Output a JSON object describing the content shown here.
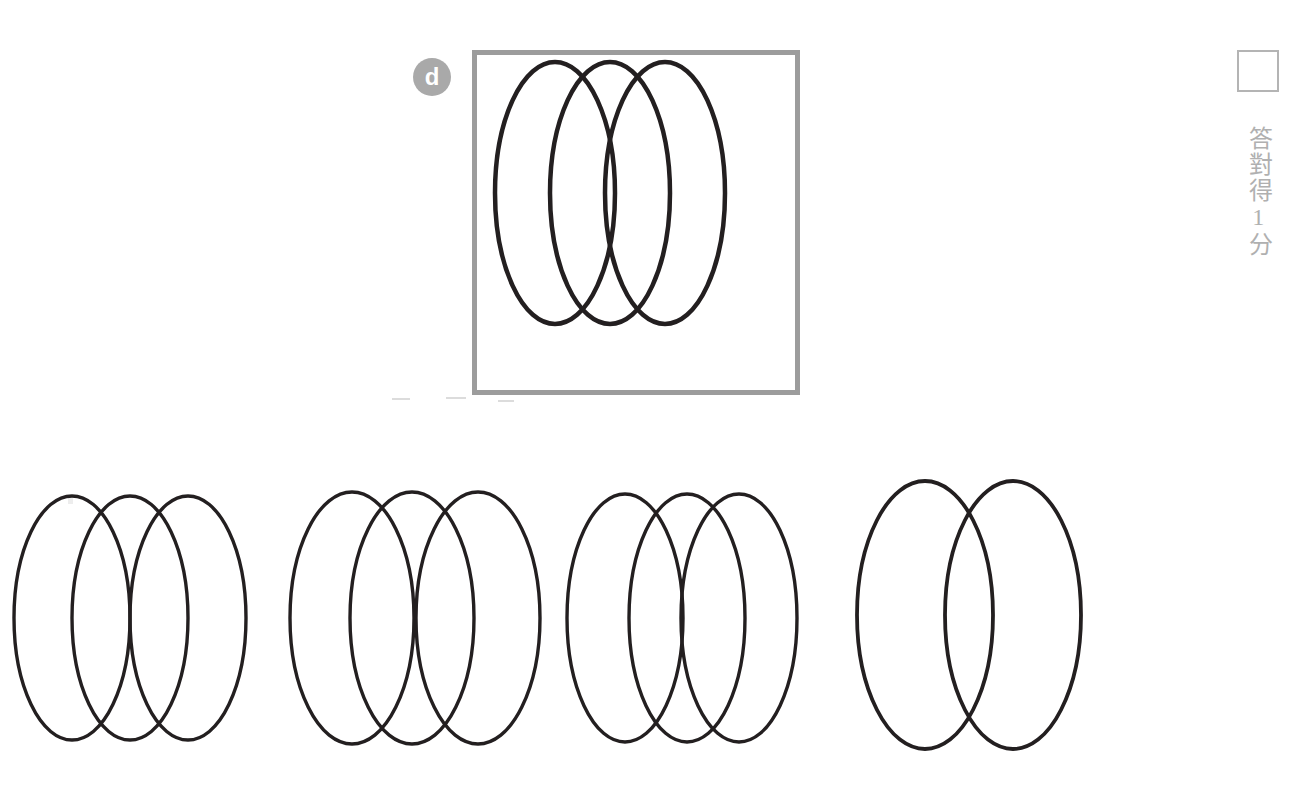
{
  "page": {
    "background_color": "#ffffff",
    "width": 1314,
    "height": 788
  },
  "question": {
    "badge_label": "d",
    "badge_color": "#a9a9a9",
    "badge_text_color": "#ffffff"
  },
  "target": {
    "border_color": "#9c9c9c",
    "stroke_color": "#231f20",
    "shape_count": 3,
    "shape_type": "ellipse"
  },
  "scoring": {
    "checkbox_border_color": "#b4b4b4",
    "label_text": "答對得1分",
    "label_color": "#b0b0b0"
  },
  "shape_data": {
    "type": "overlapping-ellipse-sets",
    "stroke_color": "#231f20",
    "target": {
      "name": "target-ellipses",
      "count": 3,
      "rx": 60,
      "ry": 131,
      "centers_x": [
        78,
        133,
        188
      ],
      "center_y": 138,
      "stroke_width": 4.5
    },
    "options": [
      {
        "id": "option-1",
        "label": "option-1",
        "count": 3,
        "rx": 58,
        "ry": 122,
        "centers_x": [
          66,
          124,
          182
        ],
        "center_y": 148,
        "stroke_width": 3.4,
        "is_correct": false
      },
      {
        "id": "option-2",
        "label": "option-2",
        "count": 3,
        "rx": 62,
        "ry": 126,
        "centers_x": [
          64,
          124,
          190
        ],
        "center_y": 148,
        "stroke_width": 3.4,
        "is_correct": true
      },
      {
        "id": "option-3",
        "label": "option-3",
        "count": 3,
        "rx": 58,
        "ry": 124,
        "centers_x": [
          62,
          124,
          176
        ],
        "center_y": 148,
        "stroke_width": 3.4,
        "is_correct": false
      },
      {
        "id": "option-4",
        "label": "option-4",
        "count": 2,
        "rx": 68,
        "ry": 134,
        "centers_x": [
          70,
          158
        ],
        "center_y": 145,
        "stroke_width": 3.8,
        "is_correct": false
      }
    ]
  }
}
